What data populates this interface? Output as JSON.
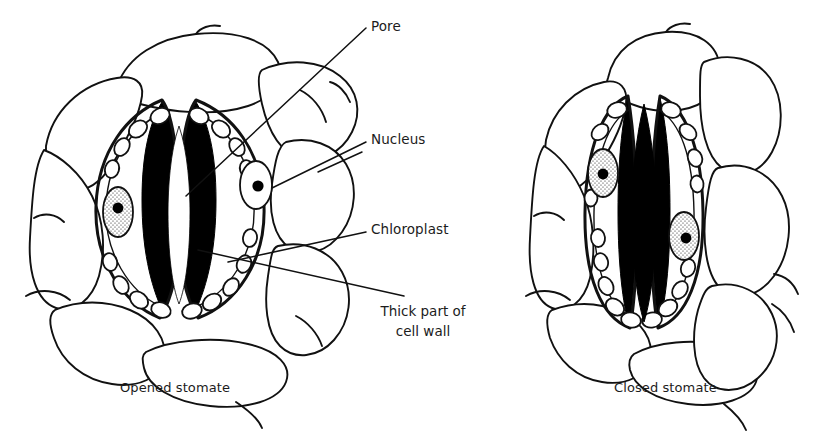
{
  "figure": {
    "title_shown": false,
    "background_color": "#ffffff",
    "ink_color": "#000000",
    "style": "line-drawing biological illustration, black ink on white"
  },
  "labels": [
    {
      "id": "pore",
      "text": "Pore",
      "x": 371,
      "y": 25,
      "leader": true
    },
    {
      "id": "nucleus",
      "text": "Nucleus",
      "x": 371,
      "y": 138,
      "leader": true
    },
    {
      "id": "chloroplast",
      "text": "Chloroplast",
      "x": 371,
      "y": 228,
      "leader": true
    },
    {
      "id": "cellwall",
      "text_line1": "Thick part of",
      "text_line2": "cell wall",
      "x": 366,
      "y": 308,
      "leader": true
    }
  ],
  "captions": [
    {
      "id": "left",
      "text": "Opened stomate",
      "x": 120,
      "y": 386
    },
    {
      "id": "right",
      "text": "Closed stomate",
      "x": 614,
      "y": 386
    }
  ],
  "diagrams": [
    {
      "id": "opened-stomate",
      "caption": "Opened stomate",
      "state": "open",
      "pore_appearance": "white lens-shaped aperture between thick black inner walls",
      "guard_cells": 2,
      "nuclei": 2,
      "chloroplasts_per_cell": 9,
      "surrounding_epidermal_cells": 7
    },
    {
      "id": "closed-stomate",
      "caption": "Closed stomate",
      "state": "closed",
      "pore_appearance": "solid black narrow slit, guard cells pressed together",
      "guard_cells": 2,
      "nuclei": 2,
      "chloroplasts_per_cell": 9,
      "surrounding_epidermal_cells": 7
    }
  ],
  "structures_labeled": [
    "Pore",
    "Nucleus",
    "Chloroplast",
    "Thick part of cell wall"
  ]
}
